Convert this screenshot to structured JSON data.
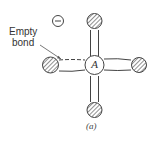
{
  "diagram": {
    "central_atom": "A",
    "charge_symbol": "−",
    "annotation": {
      "line1": "Empty",
      "line2": "bond"
    },
    "caption": "(a)",
    "colors": {
      "stroke": "#444444",
      "hatch": "#555555",
      "background": "#ffffff"
    }
  }
}
